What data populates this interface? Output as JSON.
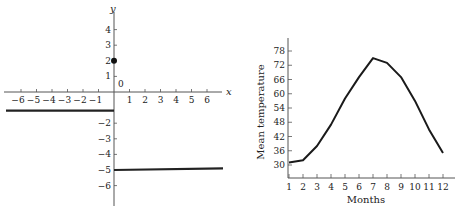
{
  "chart_data": [
    {
      "type": "line",
      "title": "",
      "description": "Piecewise function graph with a filled point at (0,2)",
      "xlabel": "x",
      "ylabel": "y",
      "origin_label": "0",
      "xlim": [
        -6.8,
        7
      ],
      "ylim": [
        -6.5,
        5
      ],
      "x_ticks": [
        -6,
        -5,
        -4,
        -3,
        -2,
        -1,
        1,
        2,
        3,
        4,
        5,
        6
      ],
      "x_tick_labels": [
        "−6",
        "−5",
        "−4",
        "−3",
        "−2",
        "−1",
        "1",
        "2",
        "3",
        "4",
        "5",
        "6"
      ],
      "y_ticks": [
        4,
        3,
        2,
        1,
        -2,
        -3,
        -4,
        -5,
        -6
      ],
      "y_tick_labels": [
        "4",
        "3",
        "2",
        "1",
        "−2",
        "−3",
        "−4",
        "−5",
        "−6"
      ],
      "grid": false,
      "series": [
        {
          "name": "left-segment",
          "x": [
            -7,
            0
          ],
          "y": [
            -1.2,
            -1.2
          ]
        },
        {
          "name": "right-segment",
          "x": [
            0,
            7
          ],
          "y": [
            -5,
            -4.9
          ]
        },
        {
          "name": "point",
          "type": "scatter",
          "x": [
            0
          ],
          "y": [
            2
          ],
          "filled": true
        }
      ]
    },
    {
      "type": "line",
      "title": "",
      "xlabel": "Months",
      "ylabel": "Mean temperature",
      "xlim": [
        1,
        12.5
      ],
      "ylim": [
        26,
        82
      ],
      "categories": [
        "1",
        "2",
        "3",
        "4",
        "5",
        "6",
        "7",
        "8",
        "9",
        "10",
        "11",
        "12"
      ],
      "y_ticks": [
        30,
        36,
        42,
        48,
        54,
        60,
        66,
        72,
        78
      ],
      "y_tick_labels": [
        "30",
        "36",
        "42",
        "48",
        "54",
        "60",
        "66",
        "72",
        "78"
      ],
      "grid": false,
      "series": [
        {
          "name": "Mean temperature",
          "values": [
            31,
            32,
            38,
            47,
            58,
            67,
            75,
            73,
            67,
            57,
            45,
            35
          ]
        }
      ]
    }
  ]
}
